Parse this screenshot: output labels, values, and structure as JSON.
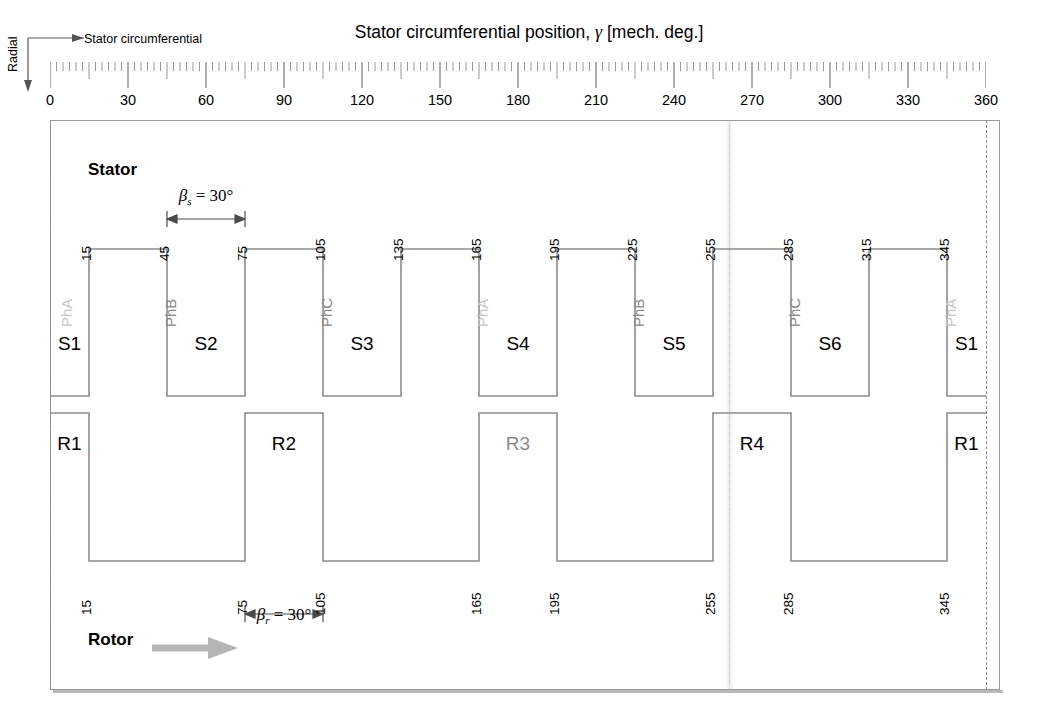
{
  "title": {
    "text": "Stator circumferential position, γ  [mech. deg.]",
    "plain": "Stator circumferential position",
    "symbol": "γ",
    "units": "[mech. deg.]"
  },
  "axes": {
    "circumferential_label": "Stator circumferential",
    "radial_label": "Radial"
  },
  "headings": {
    "stator": "Stator",
    "rotor": "Rotor"
  },
  "annotations": {
    "beta_s": {
      "symbol": "β",
      "subscript": "s",
      "value": "= 30°",
      "from": 45,
      "to": 75
    },
    "beta_r": {
      "symbol": "β",
      "subscript": "r",
      "value": "= 30°",
      "from": 75,
      "to": 105
    }
  },
  "colors": {
    "line": "#8d8d8d",
    "frame": "#9a9a9a",
    "text": "#000000",
    "phase_dim": "#c6c6c6",
    "phase_mid": "#8a8a8a",
    "rotor_arrow": "#b5b5b5",
    "center_line": "#c5c5c5"
  },
  "chart_data": {
    "type": "line",
    "xlabel": "Stator circumferential position, γ  [mech. deg.]",
    "ylabel": "Radial",
    "xlim": [
      0,
      360
    ],
    "grid": false,
    "legend": "none",
    "x_major_ticks": [
      0,
      30,
      60,
      90,
      120,
      150,
      180,
      210,
      240,
      270,
      300,
      330,
      360
    ],
    "x_tick_labels": [
      "0",
      "30",
      "60",
      "90",
      "120",
      "150",
      "180",
      "210",
      "240",
      "270",
      "300",
      "330",
      "360"
    ],
    "x_minor_tick_step": 15,
    "x_fine_tick_step": 2.5,
    "series": [
      {
        "name": "Stator tooth profile",
        "type": "square-wave",
        "duty": "high 30° / low 30°",
        "tooth_width_deg": 30,
        "high_intervals": [
          [
            15,
            45
          ],
          [
            75,
            105
          ],
          [
            135,
            165
          ],
          [
            195,
            225
          ],
          [
            255,
            285
          ],
          [
            315,
            345
          ]
        ],
        "low_intervals": [
          [
            0,
            15
          ],
          [
            45,
            75
          ],
          [
            105,
            135
          ],
          [
            165,
            195
          ],
          [
            225,
            255
          ],
          [
            285,
            315
          ],
          [
            345,
            360
          ]
        ],
        "edges": [
          15,
          45,
          75,
          105,
          135,
          165,
          195,
          225,
          255,
          285,
          315,
          345
        ]
      },
      {
        "name": "Rotor tooth profile",
        "type": "square-wave",
        "duty": "high 30° / low 60°",
        "tooth_width_deg": 30,
        "high_intervals": [
          [
            0,
            15
          ],
          [
            75,
            105
          ],
          [
            165,
            195
          ],
          [
            255,
            285
          ],
          [
            345,
            360
          ]
        ],
        "low_intervals": [
          [
            15,
            75
          ],
          [
            105,
            165
          ],
          [
            195,
            255
          ],
          [
            285,
            345
          ]
        ],
        "edges": [
          15,
          75,
          105,
          165,
          195,
          255,
          285,
          345
        ]
      }
    ]
  },
  "stator": {
    "edge_labels": [
      "15",
      "45",
      "75",
      "105",
      "135",
      "165",
      "195",
      "225",
      "255",
      "285",
      "315",
      "345"
    ],
    "edge_positions": [
      15,
      45,
      75,
      105,
      135,
      165,
      195,
      225,
      255,
      285,
      315,
      345
    ],
    "poles": [
      {
        "label": "S1",
        "center": 7.5
      },
      {
        "label": "S2",
        "center": 60
      },
      {
        "label": "S3",
        "center": 120
      },
      {
        "label": "S4",
        "center": 180
      },
      {
        "label": "S5",
        "center": 240
      },
      {
        "label": "S6",
        "center": 300
      },
      {
        "label": "S1",
        "center": 352.5
      }
    ],
    "phases": [
      {
        "label": "PhA",
        "at": 8,
        "tone": "dim"
      },
      {
        "label": "PhB",
        "at": 48,
        "tone": "mid"
      },
      {
        "label": "PhC",
        "at": 108,
        "tone": "mid"
      },
      {
        "label": "PhA",
        "at": 168,
        "tone": "dim"
      },
      {
        "label": "PhB",
        "at": 228,
        "tone": "mid"
      },
      {
        "label": "PhC",
        "at": 288,
        "tone": "mid"
      },
      {
        "label": "PhA",
        "at": 348,
        "tone": "dim"
      }
    ]
  },
  "rotor": {
    "edge_labels": [
      "15",
      "75",
      "105",
      "165",
      "195",
      "255",
      "285",
      "345"
    ],
    "edge_positions": [
      15,
      75,
      105,
      165,
      195,
      255,
      285,
      345
    ],
    "poles": [
      {
        "label": "R1",
        "center": 7.5,
        "tone": "dark"
      },
      {
        "label": "R2",
        "center": 90,
        "tone": "dark"
      },
      {
        "label": "R3",
        "center": 180,
        "tone": "dim"
      },
      {
        "label": "R4",
        "center": 270,
        "tone": "dark"
      },
      {
        "label": "R1",
        "center": 352.5,
        "tone": "dark"
      }
    ]
  }
}
